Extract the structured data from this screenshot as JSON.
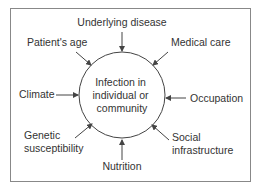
{
  "diagram": {
    "center": {
      "lines": [
        "Infection in",
        "individual or",
        "community"
      ]
    },
    "factors": {
      "underlying_disease": [
        "Underlying disease"
      ],
      "patients_age": [
        "Patient's age"
      ],
      "medical_care": [
        "Medical care"
      ],
      "climate": [
        "Climate"
      ],
      "occupation": [
        "Occupation"
      ],
      "genetic_susceptibility": [
        "Genetic",
        "susceptibility"
      ],
      "social_infrastructure": [
        "Social",
        "infrastructure"
      ],
      "nutrition": [
        "Nutrition"
      ]
    },
    "colors": {
      "stroke": "#444444",
      "border": "#888888",
      "text": "#333333",
      "background": "#ffffff"
    }
  }
}
